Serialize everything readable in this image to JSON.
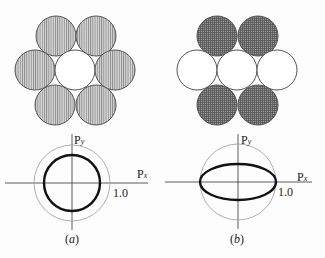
{
  "panels": [
    {
      "id": "a",
      "caption": "(a)",
      "caption_open": "(",
      "caption_letter": "a",
      "caption_close": ")",
      "pattern": "vertical-hatch (all six outer circles shaded, center open)",
      "axis_x_label": "P",
      "axis_x_sub": "x",
      "axis_y_label": "P",
      "axis_y_sub": "y",
      "tick_label": "1.0",
      "curve": "circle",
      "curve_radius_fraction": 0.74
    },
    {
      "id": "b",
      "caption": "(b)",
      "caption_open": "(",
      "caption_letter": "b",
      "caption_close": ")",
      "pattern": "cross-hatch (top and bottom pairs shaded, middle row open)",
      "axis_x_label": "P",
      "axis_x_sub": "x",
      "axis_y_label": "P",
      "axis_y_sub": "y",
      "tick_label": "1.0",
      "curve": "ellipse",
      "curve_rx_fraction": 1.0,
      "curve_ry_fraction": 0.47
    }
  ],
  "colors": {
    "stroke": "#555555",
    "thick": "#111111",
    "hatch_light": "#a9a9a9",
    "hatch_dark": "#6b6b6b",
    "guide_circle": "#9a9a9a"
  }
}
